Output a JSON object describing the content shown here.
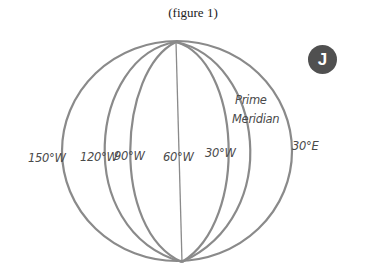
{
  "figure": {
    "caption": "(figure 1)",
    "badge_letter": "J",
    "meridian_labels": [
      {
        "text": "150°W",
        "x": 28,
        "y": 162
      },
      {
        "text": "120°W",
        "x": 80,
        "y": 161
      },
      {
        "text": "90°W",
        "x": 114,
        "y": 160
      },
      {
        "text": "60°W",
        "x": 163,
        "y": 161
      },
      {
        "text": "30°W",
        "x": 205,
        "y": 157
      },
      {
        "text": "30°E",
        "x": 292,
        "y": 150
      }
    ],
    "prime_meridian_label": {
      "line1": "Prime",
      "line2": "Meridian"
    },
    "colors": {
      "line": "#8a8a8a",
      "badge": "#505050",
      "text": "#4a4a4a"
    }
  }
}
